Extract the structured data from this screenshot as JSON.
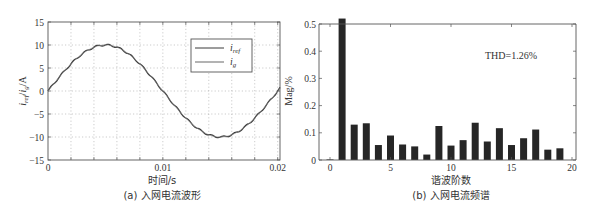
{
  "chart_data": [
    {
      "type": "line",
      "caption": "(a) 入网电流波形",
      "title": "",
      "xlabel": "时间/s",
      "ylabel": "i_ref/i_g/A",
      "xlim": [
        0,
        0.0202
      ],
      "ylim": [
        -15,
        15
      ],
      "xticks": [
        "0",
        "0.01",
        "0.02"
      ],
      "yticks": [
        "15",
        "10",
        "5",
        "0",
        "-5",
        "-10",
        "-15"
      ],
      "grid": true,
      "legend": {
        "position": "upper right",
        "entries": [
          "i_ref",
          "i_g"
        ]
      },
      "series": [
        {
          "name": "i_ref",
          "function": "10*sin(2*pi*50*t)",
          "amplitude": 10,
          "frequency_hz": 50,
          "x": [
            0,
            0.0025,
            0.005,
            0.0075,
            0.01,
            0.0125,
            0.015,
            0.0175,
            0.02
          ],
          "values": [
            0,
            7.07,
            10,
            7.07,
            0,
            -7.07,
            -10,
            -7.07,
            0
          ]
        },
        {
          "name": "i_g",
          "function": "10*sin(2*pi*50*t)",
          "amplitude": 10,
          "frequency_hz": 50,
          "x": [
            0,
            0.0025,
            0.005,
            0.0075,
            0.01,
            0.0125,
            0.015,
            0.0175,
            0.02
          ],
          "values": [
            0,
            7.07,
            10,
            7.07,
            0,
            -7.07,
            -10,
            -7.07,
            0
          ]
        }
      ]
    },
    {
      "type": "bar",
      "caption": "(b) 入网电流频谱",
      "title": "",
      "xlabel": "谐波阶数",
      "ylabel": "Mag/%",
      "xlim": [
        0,
        20
      ],
      "ylim": [
        0,
        0.5
      ],
      "xticks": [
        "0",
        "5",
        "10",
        "15",
        "20"
      ],
      "yticks": [
        "0.5",
        "0.4",
        "0.3",
        "0.2",
        "0.1",
        "0"
      ],
      "grid": false,
      "annotation": "THD=1.26%",
      "categories": [
        0,
        1,
        2,
        3,
        4,
        5,
        6,
        7,
        8,
        9,
        10,
        11,
        12,
        13,
        14,
        15,
        16,
        17,
        18,
        19
      ],
      "values": [
        0.002,
        0.52,
        0.13,
        0.135,
        0.055,
        0.09,
        0.057,
        0.05,
        0.02,
        0.125,
        0.053,
        0.073,
        0.137,
        0.068,
        0.117,
        0.055,
        0.08,
        0.112,
        0.038,
        0.043
      ]
    }
  ],
  "figure": {
    "left": {
      "ylabel_parts": {
        "i1": "i",
        "sub1": "ref",
        "slash": "/",
        "i2": "i",
        "sub2": "g",
        "unit": "/A"
      },
      "legend_labels": {
        "ref_i": "i",
        "ref_sub": "ref",
        "g_i": "i",
        "g_sub": "g"
      },
      "line_colors": {
        "i_ref": "#3a3a3a",
        "i_g": "#8a8a8a"
      }
    },
    "right": {
      "bar_color": "#262626"
    }
  }
}
